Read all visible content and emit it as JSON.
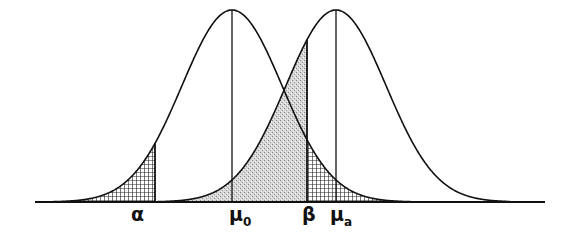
{
  "diagram": {
    "title": "",
    "type": "hypothesis-testing-normal-curves",
    "curves": [
      {
        "name": "null-distribution",
        "mean_label": "μ0",
        "center_x": 232
      },
      {
        "name": "alternative-distribution",
        "mean_label": "μa",
        "center_x": 336
      }
    ],
    "critical_value_x": 307,
    "regions": [
      {
        "name": "alpha-region",
        "label": "α",
        "fill": "crosshatch"
      },
      {
        "name": "beta-region",
        "label": "β",
        "fill": "stipple"
      }
    ],
    "colors": {
      "ink": "#111111",
      "stipple": "#c8c8c8",
      "hatch": "#333333",
      "background": "#ffffff"
    }
  },
  "labels": {
    "alpha": "α",
    "mu0_base": "μ",
    "mu0_sub": "0",
    "beta": "β",
    "mua_base": "μ",
    "mua_sub": "a"
  }
}
